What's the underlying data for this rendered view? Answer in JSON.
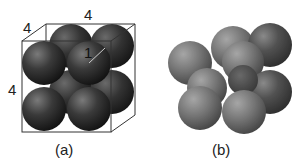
{
  "figure": {
    "panel_a": {
      "caption": "(a)",
      "labels": {
        "top_edge": "4",
        "depth_edge": "4",
        "side_edge": "4",
        "radius": "1"
      },
      "description": "Cube of edge 4 packed with eight spheres of radius 1 (2x2x2)"
    },
    "panel_b": {
      "caption": "(b)",
      "description": "Eight translucent spheres arranged in cube with a smaller central sphere"
    },
    "colors": {
      "sphere_dark": "#1a1a1a",
      "sphere_mid": "#4a4a4a",
      "sphere_light": "#8a8a8a",
      "edge": "#333333",
      "background": "#ffffff"
    }
  }
}
